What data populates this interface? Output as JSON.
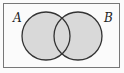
{
  "diagram": {
    "type": "venn",
    "universe": {
      "x": 3,
      "y": 3,
      "width": 117,
      "height": 65,
      "stroke": "#777777"
    },
    "sets": [
      {
        "label": "A",
        "cx": 46,
        "cy": 36,
        "r": 24
      },
      {
        "label": "B",
        "cx": 78,
        "cy": 36,
        "r": 24
      }
    ],
    "shaded_region": "A ∪ B",
    "fill_color": "#d9d9d9",
    "stroke_color": "#333333"
  }
}
